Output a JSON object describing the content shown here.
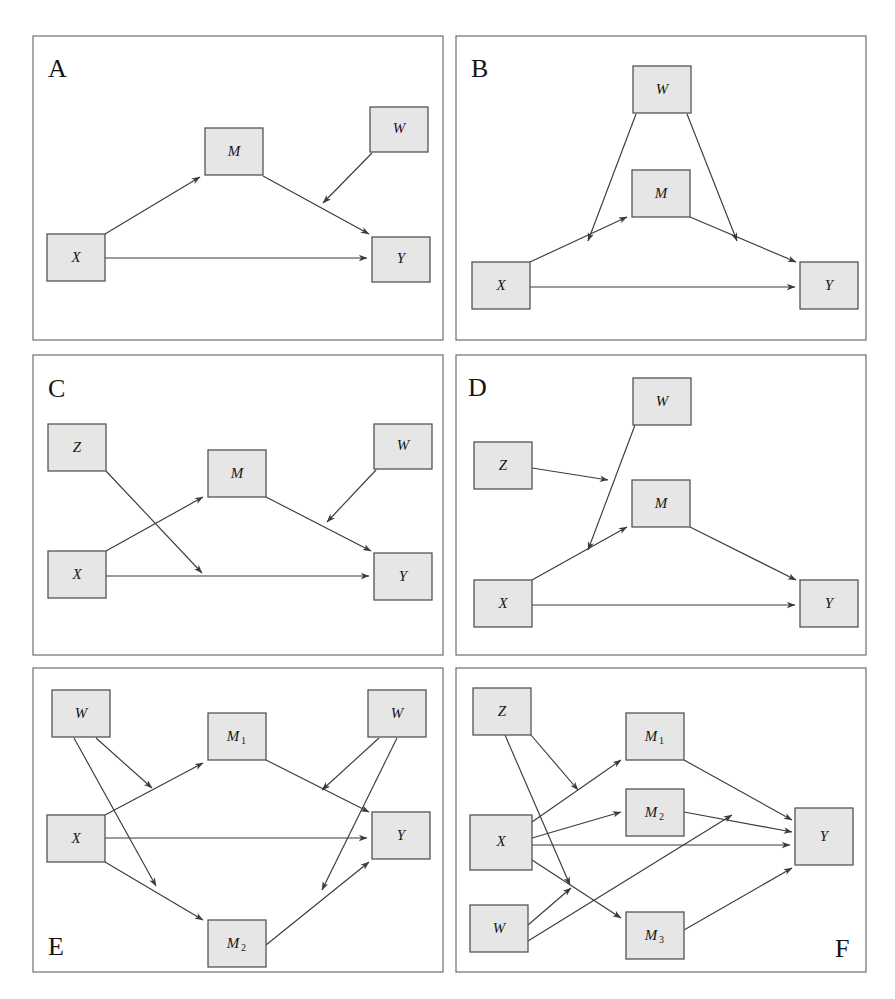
{
  "figure": {
    "background_color": "#ffffff",
    "node_fill_color": "#e6e6e6",
    "node_stroke_color": "#555555",
    "edge_color": "#3b3b3b",
    "frame_color": "#6f6f6f",
    "panel_count": 6
  },
  "panels": [
    {
      "letter": "A",
      "letter_position": "top-left",
      "frame": {
        "x": 33,
        "y": 36,
        "w": 410,
        "h": 304
      },
      "nodes": [
        {
          "id": "X",
          "label": "X",
          "sub": "",
          "x": 47,
          "y": 234,
          "w": 58,
          "h": 47
        },
        {
          "id": "M",
          "label": "M",
          "sub": "",
          "x": 205,
          "y": 128,
          "w": 58,
          "h": 47
        },
        {
          "id": "W",
          "label": "W",
          "sub": "",
          "x": 370,
          "y": 107,
          "w": 58,
          "h": 45
        },
        {
          "id": "Y",
          "label": "Y",
          "sub": "",
          "x": 372,
          "y": 237,
          "w": 58,
          "h": 45
        }
      ],
      "edges": [
        {
          "from": "X",
          "to": "M",
          "kind": "direct"
        },
        {
          "from": "M",
          "to": "Y",
          "kind": "direct"
        },
        {
          "from": "X",
          "to": "Y",
          "kind": "direct"
        },
        {
          "from": "W",
          "to": "M->Y",
          "kind": "moderation"
        }
      ]
    },
    {
      "letter": "B",
      "letter_position": "top-left",
      "frame": {
        "x": 456,
        "y": 36,
        "w": 410,
        "h": 304
      },
      "nodes": [
        {
          "id": "X",
          "label": "X",
          "sub": "",
          "x": 472,
          "y": 262,
          "w": 58,
          "h": 47
        },
        {
          "id": "M",
          "label": "M",
          "sub": "",
          "x": 632,
          "y": 170,
          "w": 58,
          "h": 47
        },
        {
          "id": "W",
          "label": "W",
          "sub": "",
          "x": 633,
          "y": 66,
          "w": 58,
          "h": 47
        },
        {
          "id": "Y",
          "label": "Y",
          "sub": "",
          "x": 800,
          "y": 262,
          "w": 58,
          "h": 47
        }
      ],
      "edges": [
        {
          "from": "X",
          "to": "M",
          "kind": "direct"
        },
        {
          "from": "M",
          "to": "Y",
          "kind": "direct"
        },
        {
          "from": "X",
          "to": "Y",
          "kind": "direct"
        },
        {
          "from": "W",
          "to": "X->M",
          "kind": "moderation"
        },
        {
          "from": "W",
          "to": "M->Y",
          "kind": "moderation"
        }
      ]
    },
    {
      "letter": "C",
      "letter_position": "top-left",
      "frame": {
        "x": 33,
        "y": 355,
        "w": 410,
        "h": 300
      },
      "nodes": [
        {
          "id": "Z",
          "label": "Z",
          "sub": "",
          "x": 48,
          "y": 424,
          "w": 58,
          "h": 47
        },
        {
          "id": "X",
          "label": "X",
          "sub": "",
          "x": 48,
          "y": 551,
          "w": 58,
          "h": 47
        },
        {
          "id": "M",
          "label": "M",
          "sub": "",
          "x": 208,
          "y": 450,
          "w": 58,
          "h": 47
        },
        {
          "id": "W",
          "label": "W",
          "sub": "",
          "x": 374,
          "y": 424,
          "w": 58,
          "h": 45
        },
        {
          "id": "Y",
          "label": "Y",
          "sub": "",
          "x": 374,
          "y": 553,
          "w": 58,
          "h": 47
        }
      ],
      "edges": [
        {
          "from": "X",
          "to": "M",
          "kind": "direct"
        },
        {
          "from": "M",
          "to": "Y",
          "kind": "direct"
        },
        {
          "from": "X",
          "to": "Y",
          "kind": "direct"
        },
        {
          "from": "Z",
          "to": "X->Y",
          "kind": "moderation"
        },
        {
          "from": "W",
          "to": "M->Y",
          "kind": "moderation"
        }
      ]
    },
    {
      "letter": "D",
      "letter_position": "top-left",
      "frame": {
        "x": 456,
        "y": 355,
        "w": 410,
        "h": 300
      },
      "nodes": [
        {
          "id": "Z",
          "label": "Z",
          "sub": "",
          "x": 474,
          "y": 442,
          "w": 58,
          "h": 47
        },
        {
          "id": "X",
          "label": "X",
          "sub": "",
          "x": 474,
          "y": 580,
          "w": 58,
          "h": 47
        },
        {
          "id": "M",
          "label": "M",
          "sub": "",
          "x": 632,
          "y": 480,
          "w": 58,
          "h": 47
        },
        {
          "id": "W",
          "label": "W",
          "sub": "",
          "x": 633,
          "y": 378,
          "w": 58,
          "h": 47
        },
        {
          "id": "Y",
          "label": "Y",
          "sub": "",
          "x": 800,
          "y": 580,
          "w": 58,
          "h": 47
        }
      ],
      "edges": [
        {
          "from": "X",
          "to": "M",
          "kind": "direct"
        },
        {
          "from": "M",
          "to": "Y",
          "kind": "direct"
        },
        {
          "from": "X",
          "to": "Y",
          "kind": "direct"
        },
        {
          "from": "W",
          "to": "X->M",
          "kind": "moderation"
        },
        {
          "from": "Z",
          "to": "W->X->M",
          "kind": "moderation"
        }
      ]
    },
    {
      "letter": "E",
      "letter_position": "bottom-left",
      "frame": {
        "x": 33,
        "y": 668,
        "w": 410,
        "h": 304
      },
      "nodes": [
        {
          "id": "Wleft",
          "label": "W",
          "sub": "",
          "x": 52,
          "y": 690,
          "w": 58,
          "h": 47
        },
        {
          "id": "X",
          "label": "X",
          "sub": "",
          "x": 47,
          "y": 815,
          "w": 58,
          "h": 47
        },
        {
          "id": "M1",
          "label": "M",
          "sub": "1",
          "x": 208,
          "y": 713,
          "w": 58,
          "h": 47
        },
        {
          "id": "M2",
          "label": "M",
          "sub": "2",
          "x": 208,
          "y": 920,
          "w": 58,
          "h": 47
        },
        {
          "id": "Wright",
          "label": "W",
          "sub": "",
          "x": 368,
          "y": 690,
          "w": 58,
          "h": 47
        },
        {
          "id": "Y",
          "label": "Y",
          "sub": "",
          "x": 372,
          "y": 812,
          "w": 58,
          "h": 47
        }
      ],
      "edges": [
        {
          "from": "X",
          "to": "M1",
          "kind": "direct"
        },
        {
          "from": "X",
          "to": "M2",
          "kind": "direct"
        },
        {
          "from": "X",
          "to": "Y",
          "kind": "direct"
        },
        {
          "from": "M1",
          "to": "Y",
          "kind": "direct"
        },
        {
          "from": "M2",
          "to": "Y",
          "kind": "direct"
        },
        {
          "from": "Wleft",
          "to": "X->M1",
          "kind": "moderation"
        },
        {
          "from": "Wleft",
          "to": "X->M2",
          "kind": "moderation"
        },
        {
          "from": "Wright",
          "to": "M1->Y",
          "kind": "moderation"
        },
        {
          "from": "Wright",
          "to": "M2->Y",
          "kind": "moderation"
        }
      ]
    },
    {
      "letter": "F",
      "letter_position": "bottom-right",
      "frame": {
        "x": 456,
        "y": 668,
        "w": 410,
        "h": 304
      },
      "nodes": [
        {
          "id": "Z",
          "label": "Z",
          "sub": "",
          "x": 473,
          "y": 688,
          "w": 58,
          "h": 47
        },
        {
          "id": "X",
          "label": "X",
          "sub": "",
          "x": 470,
          "y": 815,
          "w": 62,
          "h": 55
        },
        {
          "id": "M1",
          "label": "M",
          "sub": "1",
          "x": 626,
          "y": 713,
          "w": 58,
          "h": 47
        },
        {
          "id": "M2",
          "label": "M",
          "sub": "2",
          "x": 626,
          "y": 789,
          "w": 58,
          "h": 47
        },
        {
          "id": "M3",
          "label": "M",
          "sub": "3",
          "x": 626,
          "y": 912,
          "w": 58,
          "h": 47
        },
        {
          "id": "W",
          "label": "W",
          "sub": "",
          "x": 470,
          "y": 905,
          "w": 58,
          "h": 47
        },
        {
          "id": "Y",
          "label": "Y",
          "sub": "",
          "x": 795,
          "y": 808,
          "w": 58,
          "h": 57
        }
      ],
      "edges": [
        {
          "from": "X",
          "to": "M1",
          "kind": "direct"
        },
        {
          "from": "X",
          "to": "M2",
          "kind": "direct"
        },
        {
          "from": "X",
          "to": "M3",
          "kind": "direct"
        },
        {
          "from": "X",
          "to": "Y",
          "kind": "direct"
        },
        {
          "from": "M1",
          "to": "Y",
          "kind": "direct"
        },
        {
          "from": "M2",
          "to": "Y",
          "kind": "direct"
        },
        {
          "from": "M3",
          "to": "Y",
          "kind": "direct"
        },
        {
          "from": "Z",
          "to": "X->M1",
          "kind": "moderation"
        },
        {
          "from": "Z",
          "to": "X->M3",
          "kind": "moderation"
        },
        {
          "from": "W",
          "to": "X->M3",
          "kind": "moderation"
        },
        {
          "from": "W",
          "to": "M2->Y",
          "kind": "moderation"
        }
      ]
    }
  ]
}
